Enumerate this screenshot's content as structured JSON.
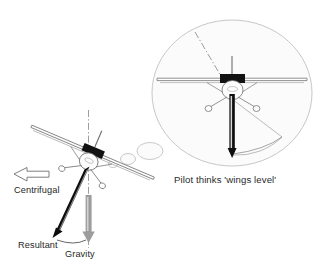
{
  "figure": {
    "title_caption": "Pilot thinks 'wings level'",
    "background_color": "#ffffff",
    "line_color": "#7d7d7d",
    "dark_color": "#111111",
    "gray_arrow_color": "#9a9a9a",
    "bubble_fill": "#fbfbfc",
    "bubble_stroke": "#b9b9bd"
  },
  "labels": {
    "centrifugal": "Centrifugal",
    "resultant": "Resultant",
    "gravity": "Gravity"
  },
  "forces": [
    {
      "name": "centrifugal",
      "label": "Centrifugal",
      "style": "hollow-outline-arrow",
      "direction": "left",
      "color": "#6f6f6f"
    },
    {
      "name": "resultant",
      "label": "Resultant",
      "style": "solid-black-arrow",
      "direction": "down-left",
      "color": "#111111"
    },
    {
      "name": "gravity",
      "label": "Gravity",
      "style": "solid-gray-arrow",
      "direction": "down",
      "color": "#9a9a9a"
    }
  ],
  "thought_bubble": {
    "caption": "Pilot thinks 'wings level'",
    "tail_bubbles": 3,
    "contents_description": "front view of aircraft appearing wings level with resultant force arrow pointing straight down"
  },
  "aircraft": {
    "left_view": {
      "name": "banked-aircraft",
      "bank_angle_degrees": 23,
      "orientation": "banked left"
    },
    "bubble_view": {
      "name": "level-aircraft",
      "bank_angle_degrees": 0,
      "orientation": "wings level"
    }
  }
}
